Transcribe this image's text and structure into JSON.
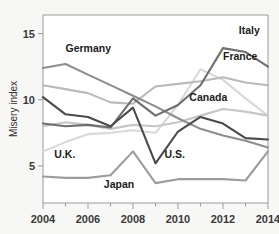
{
  "chart_data": {
    "type": "line",
    "title": "",
    "subtitle": "",
    "xlabel": "",
    "ylabel": "Misery index",
    "x": [
      2004,
      2005,
      2006,
      2007,
      2008,
      2009,
      2010,
      2011,
      2012,
      2013,
      2014
    ],
    "xlim": [
      2004,
      2014
    ],
    "ylim": [
      2.2,
      16.4
    ],
    "xticks": [
      2004,
      2006,
      2008,
      2010,
      2012,
      2014
    ],
    "xtick_labels": [
      "2004",
      "2006",
      "2008",
      "2010",
      "2012",
      "2014"
    ],
    "yticks": [
      5,
      10,
      15
    ],
    "ytick_labels": [
      "5",
      "10",
      "15"
    ],
    "grid": false,
    "legend_position": "inline-labels",
    "series": [
      {
        "name": "Germany",
        "color": "#8d8d8d",
        "label": "Germany",
        "values": [
          12.4,
          12.7,
          11.9,
          11.1,
          10.3,
          9.5,
          8.6,
          7.8,
          7.3,
          6.9,
          6.4
        ]
      },
      {
        "name": "France",
        "color": "#b9b9b9",
        "label": "France",
        "values": [
          11.1,
          10.8,
          10.5,
          9.8,
          9.7,
          11.0,
          11.2,
          11.4,
          11.7,
          11.3,
          11.1
        ]
      },
      {
        "name": "Italy",
        "color": "#6e6e6e",
        "label": "Italy",
        "values": [
          8.2,
          8.0,
          8.1,
          7.9,
          10.1,
          8.8,
          9.6,
          11.1,
          13.9,
          13.6,
          12.5
        ]
      },
      {
        "name": "Canada",
        "color": "#c6c6c6",
        "label": "Canada",
        "values": [
          8.0,
          8.3,
          8.1,
          7.8,
          8.1,
          8.0,
          8.3,
          8.8,
          9.3,
          9.1,
          8.8
        ]
      },
      {
        "name": "U.S.",
        "color": "#4a4a4a",
        "label": "U.S.",
        "values": [
          10.2,
          8.9,
          8.7,
          8.0,
          9.4,
          5.2,
          7.6,
          8.7,
          8.2,
          7.1,
          7.0
        ]
      },
      {
        "name": "U.K.",
        "color": "#d8d8d8",
        "label": "U.K.",
        "values": [
          6.1,
          6.8,
          7.4,
          7.5,
          7.7,
          7.5,
          9.6,
          12.3,
          11.5,
          10.1,
          8.8
        ]
      },
      {
        "name": "Japan",
        "color": "#9c9c9c",
        "label": "Japan",
        "values": [
          4.2,
          4.1,
          4.1,
          4.3,
          6.1,
          3.7,
          4.0,
          4.0,
          4.0,
          3.9,
          6.1
        ]
      }
    ],
    "annotations": [
      {
        "text": "Germany",
        "x": 2005.0,
        "y": 13.6,
        "anchor": "start"
      },
      {
        "text": "Italy",
        "x": 2012.7,
        "y": 15.0,
        "anchor": "start"
      },
      {
        "text": "France",
        "x": 2012.0,
        "y": 13.0,
        "anchor": "start"
      },
      {
        "text": "Canada",
        "x": 2010.5,
        "y": 9.9,
        "anchor": "start"
      },
      {
        "text": "U.K.",
        "x": 2004.5,
        "y": 5.6,
        "anchor": "start"
      },
      {
        "text": "U.S.",
        "x": 2009.4,
        "y": 5.6,
        "anchor": "start"
      },
      {
        "text": "Japan",
        "x": 2006.7,
        "y": 3.3,
        "anchor": "start"
      }
    ]
  },
  "axes": {
    "ylabel": "Misery index"
  }
}
